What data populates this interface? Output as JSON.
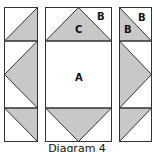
{
  "caption": "Diagram 4",
  "colors": {
    "fill": "#c8c8c8",
    "stroke": "#333333",
    "background": "#ffffff",
    "label": "#111111"
  },
  "labels": {
    "center_square": "A",
    "corner_triangle": "B",
    "corner_triangle_right_top": "B",
    "corner_triangle_right_inner": "B",
    "goose_triangle": "C"
  },
  "panels": [
    {
      "name": "left-column",
      "x": 4,
      "width": 33
    },
    {
      "name": "center-column",
      "x": 45,
      "width": 66
    },
    {
      "name": "right-column",
      "x": 119,
      "width": 32
    }
  ],
  "rows": [
    {
      "name": "top-row",
      "y": 7,
      "height": 34
    },
    {
      "name": "middle-row",
      "y": 41,
      "height": 67
    },
    {
      "name": "bottom-row",
      "y": 108,
      "height": 33
    }
  ]
}
